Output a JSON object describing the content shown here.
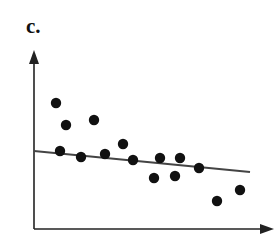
{
  "panel_label": "c.",
  "colors": {
    "points": "#111111",
    "axes": "#222222",
    "fit_line": "#444444"
  },
  "chart_data": {
    "type": "scatter",
    "title": "",
    "xlabel": "",
    "ylabel": "",
    "grid": false,
    "legend": null,
    "axes": {
      "x_ticks": false,
      "y_ticks": false,
      "arrowheads": true
    },
    "note": "Unlabeled axes; coordinates given in pixel space of the 276x242 image",
    "points": [
      {
        "x": 56,
        "y": 103
      },
      {
        "x": 66,
        "y": 125
      },
      {
        "x": 94,
        "y": 120
      },
      {
        "x": 60,
        "y": 151
      },
      {
        "x": 81,
        "y": 157
      },
      {
        "x": 105,
        "y": 154
      },
      {
        "x": 123,
        "y": 144
      },
      {
        "x": 133,
        "y": 160
      },
      {
        "x": 154,
        "y": 178
      },
      {
        "x": 160,
        "y": 158
      },
      {
        "x": 175,
        "y": 176
      },
      {
        "x": 180,
        "y": 158
      },
      {
        "x": 199,
        "y": 168
      },
      {
        "x": 217,
        "y": 201
      },
      {
        "x": 240,
        "y": 190
      }
    ],
    "fit_line": {
      "x1": 34,
      "y1": 151,
      "x2": 250,
      "y2": 172,
      "trend": "slightly decreasing"
    }
  }
}
